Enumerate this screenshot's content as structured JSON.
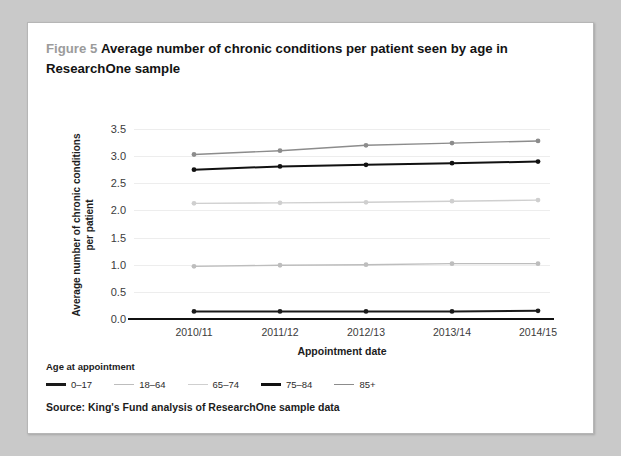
{
  "figure": {
    "label": "Figure 5",
    "title": "Average number of chronic conditions per patient seen by age in ResearchOne sample",
    "source": "Source: King's Fund analysis of ResearchOne sample data"
  },
  "legend": {
    "title": "Age at appointment"
  },
  "chart_data": {
    "type": "line",
    "title": "Average number of chronic conditions per patient seen by age in ResearchOne sample",
    "xlabel": "Appointment date",
    "ylabel": "Average number of chronic conditions per patient",
    "categories": [
      "2010/11",
      "2011/12",
      "2012/13",
      "2013/14",
      "2014/15"
    ],
    "ylim": [
      0.0,
      3.5
    ],
    "yticks": [
      "0.0",
      "0.5",
      "1.0",
      "1.5",
      "2.0",
      "2.5",
      "3.0",
      "3.5"
    ],
    "grid": true,
    "legend_position": "below-plot",
    "markers": true,
    "series": [
      {
        "name": "0–17",
        "color": "#1a1a1a",
        "values": [
          0.14,
          0.14,
          0.14,
          0.14,
          0.15
        ]
      },
      {
        "name": "18–64",
        "color": "#bdbdbd",
        "values": [
          0.97,
          0.99,
          1.0,
          1.02,
          1.02
        ]
      },
      {
        "name": "65–74",
        "color": "#cfcfcf",
        "values": [
          2.13,
          2.14,
          2.15,
          2.17,
          2.19
        ]
      },
      {
        "name": "75–84",
        "color": "#111111",
        "values": [
          2.75,
          2.81,
          2.84,
          2.87,
          2.9
        ]
      },
      {
        "name": "85+",
        "color": "#8c8c8c",
        "values": [
          3.03,
          3.1,
          3.2,
          3.24,
          3.28
        ]
      }
    ]
  }
}
